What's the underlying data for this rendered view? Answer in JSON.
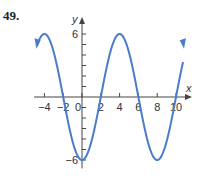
{
  "problem_number": "49.",
  "chart_data": {
    "type": "line",
    "title": "",
    "xlabel": "x",
    "ylabel": "y",
    "xlim": [
      -5,
      11
    ],
    "ylim": [
      -7,
      7
    ],
    "x_ticks": [
      -4,
      -2,
      0,
      2,
      4,
      6,
      8,
      10
    ],
    "y_tick_labels": [
      6,
      -6
    ],
    "y_ticks": [
      -6,
      -5,
      -4,
      -3,
      -2,
      -1,
      1,
      2,
      3,
      4,
      5,
      6
    ],
    "grid": false,
    "series": [
      {
        "name": "y = -6cos(πx/4)",
        "color": "#4a7cc9",
        "x": [
          -4.8,
          -4,
          -2,
          0,
          2,
          4,
          6,
          8,
          10,
          10.8
        ],
        "y": [
          4.85,
          6,
          0,
          -6,
          0,
          6,
          0,
          -6,
          0,
          4.85
        ]
      }
    ]
  }
}
